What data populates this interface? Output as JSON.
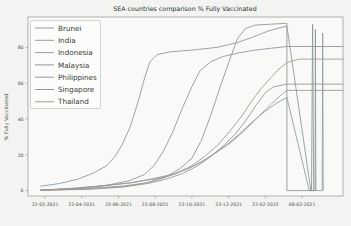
{
  "figure": {
    "background": "#f3f4f1",
    "plot_background": "#f9faf7",
    "spine_color": "#9aa29c",
    "tick_color": "#4a524c",
    "legend_fill": "#fcfdfb",
    "legend_border": "#c6ccc6",
    "legend_text_color": "#333b35"
  },
  "chart_data": {
    "type": "line",
    "title": "SEA countries comparison % Fully Vaccinated",
    "xlabel": "",
    "ylabel": "% Fully Vaccinated",
    "ylim": [
      -3,
      97
    ],
    "y_ticks": [
      0,
      20,
      40,
      60,
      80
    ],
    "grid": false,
    "legend_position": "upper left",
    "x_ticks": [
      {
        "label": "22-02-2021",
        "frac": 0.054
      },
      {
        "label": "22-04-2021",
        "frac": 0.1706
      },
      {
        "label": "22-06-2021",
        "frac": 0.2872
      },
      {
        "label": "22-08-2021",
        "frac": 0.4038
      },
      {
        "label": "23-10-2021",
        "frac": 0.5204
      },
      {
        "label": "23-12-2021",
        "frac": 0.637
      },
      {
        "label": "22-02-2022",
        "frac": 0.7536
      },
      {
        "label": "08-02-2021",
        "frac": 0.8702
      }
    ],
    "series": [
      {
        "name": "Brunei",
        "color": "#8f9b93",
        "points": [
          [
            0.04,
            0.4
          ],
          [
            0.18,
            1.2
          ],
          [
            0.3,
            2.5
          ],
          [
            0.38,
            4.5
          ],
          [
            0.44,
            8
          ],
          [
            0.48,
            12
          ],
          [
            0.52,
            18
          ],
          [
            0.55,
            28
          ],
          [
            0.58,
            42
          ],
          [
            0.61,
            58
          ],
          [
            0.64,
            73
          ],
          [
            0.665,
            85
          ],
          [
            0.69,
            90.5
          ],
          [
            0.72,
            92.5
          ],
          [
            0.77,
            93
          ],
          [
            0.822,
            93.5
          ],
          [
            0.822,
            0
          ],
          [
            0.9,
            0
          ],
          [
            0.9035,
            93
          ],
          [
            0.907,
            0
          ]
        ]
      },
      {
        "name": "India",
        "color": "#a09a92",
        "points": [
          [
            0.04,
            0.3
          ],
          [
            0.12,
            1
          ],
          [
            0.22,
            2.5
          ],
          [
            0.32,
            4.2
          ],
          [
            0.4,
            6.5
          ],
          [
            0.46,
            9
          ],
          [
            0.51,
            12.5
          ],
          [
            0.555,
            16.5
          ],
          [
            0.6,
            21.5
          ],
          [
            0.645,
            27
          ],
          [
            0.69,
            34
          ],
          [
            0.73,
            41
          ],
          [
            0.77,
            48
          ],
          [
            0.8,
            53
          ],
          [
            0.822,
            56
          ],
          [
            1.0,
            56
          ]
        ]
      },
      {
        "name": "Indonesia",
        "color": "#939ea4",
        "points": [
          [
            0.04,
            0.2
          ],
          [
            0.15,
            1.2
          ],
          [
            0.25,
            2.8
          ],
          [
            0.33,
            4.5
          ],
          [
            0.4,
            6.8
          ],
          [
            0.46,
            9.2
          ],
          [
            0.51,
            12.5
          ],
          [
            0.55,
            16
          ],
          [
            0.59,
            20.5
          ],
          [
            0.63,
            25.5
          ],
          [
            0.67,
            31.5
          ],
          [
            0.71,
            38
          ],
          [
            0.75,
            44
          ],
          [
            0.79,
            49
          ],
          [
            0.822,
            52
          ],
          [
            0.893,
            0
          ],
          [
            0.934,
            0
          ],
          [
            0.9355,
            88
          ],
          [
            0.937,
            0
          ]
        ]
      },
      {
        "name": "Malaysia",
        "color": "#9b93a0",
        "points": [
          [
            0.04,
            0.3
          ],
          [
            0.15,
            1.2
          ],
          [
            0.25,
            3
          ],
          [
            0.32,
            5.5
          ],
          [
            0.37,
            9
          ],
          [
            0.4,
            14
          ],
          [
            0.43,
            22
          ],
          [
            0.46,
            33
          ],
          [
            0.49,
            46
          ],
          [
            0.52,
            58
          ],
          [
            0.546,
            67
          ],
          [
            0.58,
            72
          ],
          [
            0.62,
            75
          ],
          [
            0.67,
            77
          ],
          [
            0.72,
            78.5
          ],
          [
            0.77,
            79.5
          ],
          [
            0.822,
            80.5
          ],
          [
            1.0,
            80.5
          ]
        ]
      },
      {
        "name": "Philippines",
        "color": "#a4939b",
        "points": [
          [
            0.04,
            0.1
          ],
          [
            0.2,
            0.8
          ],
          [
            0.3,
            2
          ],
          [
            0.38,
            4
          ],
          [
            0.44,
            6.5
          ],
          [
            0.49,
            9.5
          ],
          [
            0.54,
            14
          ],
          [
            0.58,
            19
          ],
          [
            0.62,
            25
          ],
          [
            0.66,
            32
          ],
          [
            0.695,
            40
          ],
          [
            0.725,
            48
          ],
          [
            0.755,
            55
          ],
          [
            0.78,
            58
          ],
          [
            0.822,
            59.5
          ],
          [
            1.0,
            59.5
          ]
        ]
      },
      {
        "name": "Singapore",
        "color": "#8e9aa0",
        "points": [
          [
            0.04,
            2.5
          ],
          [
            0.1,
            4
          ],
          [
            0.16,
            6.5
          ],
          [
            0.21,
            10
          ],
          [
            0.25,
            14
          ],
          [
            0.276,
            19
          ],
          [
            0.3,
            26
          ],
          [
            0.325,
            36
          ],
          [
            0.35,
            50
          ],
          [
            0.37,
            63
          ],
          [
            0.387,
            72
          ],
          [
            0.41,
            76
          ],
          [
            0.45,
            77.5
          ],
          [
            0.52,
            78.5
          ],
          [
            0.6,
            80
          ],
          [
            0.66,
            82.5
          ],
          [
            0.71,
            85.5
          ],
          [
            0.76,
            89
          ],
          [
            0.8,
            91
          ],
          [
            0.822,
            92
          ],
          [
            0.898,
            0
          ],
          [
            0.911,
            0
          ],
          [
            0.9125,
            90
          ],
          [
            0.914,
            0
          ]
        ]
      },
      {
        "name": "Thailand",
        "color": "#9aa08e",
        "points": [
          [
            0.04,
            0.2
          ],
          [
            0.2,
            1
          ],
          [
            0.3,
            2.2
          ],
          [
            0.37,
            4
          ],
          [
            0.42,
            6.5
          ],
          [
            0.47,
            9.5
          ],
          [
            0.52,
            14
          ],
          [
            0.56,
            19
          ],
          [
            0.6,
            25
          ],
          [
            0.64,
            33
          ],
          [
            0.68,
            42
          ],
          [
            0.71,
            50
          ],
          [
            0.74,
            57
          ],
          [
            0.77,
            63
          ],
          [
            0.8,
            68.5
          ],
          [
            0.822,
            71.5
          ],
          [
            0.86,
            73.5
          ],
          [
            1.0,
            73.5
          ]
        ]
      }
    ]
  }
}
